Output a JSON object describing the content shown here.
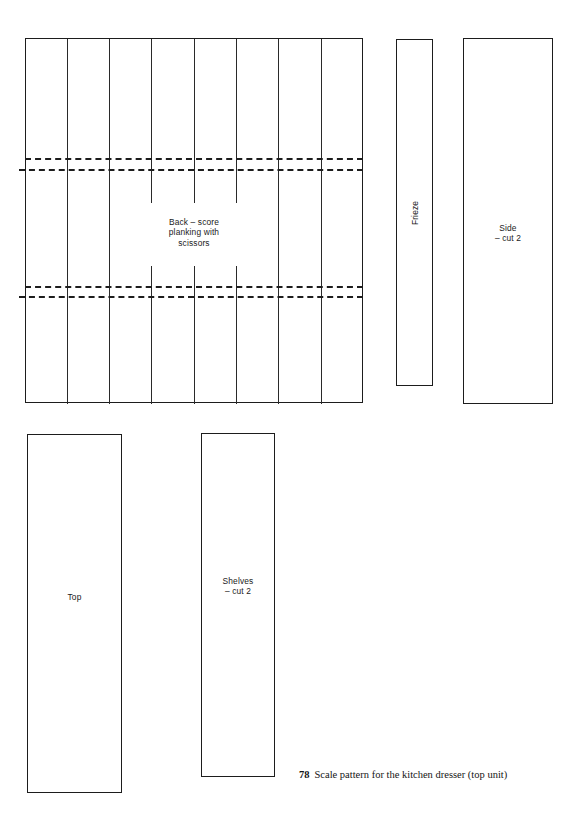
{
  "figure": {
    "caption_number": "78",
    "caption_text": "Scale pattern for the kitchen dresser (top unit)"
  },
  "pieces": {
    "back": {
      "label": "Back  –  score\nplanking with\nscissors",
      "name": "Back",
      "plank_count": 8,
      "score_line_pairs": 2
    },
    "frieze": {
      "label": "Frieze",
      "name": "Frieze"
    },
    "side": {
      "label": "Side\n–  cut 2",
      "name": "Side",
      "cut_quantity": "2"
    },
    "top": {
      "label": "Top",
      "name": "Top"
    },
    "shelves": {
      "label": "Shelves\n–  cut 2",
      "name": "Shelves",
      "cut_quantity": "2"
    }
  },
  "style": {
    "line_color": "#1d1d1d",
    "plank_line_color": "#2a2a2a",
    "background": "#ffffff"
  }
}
